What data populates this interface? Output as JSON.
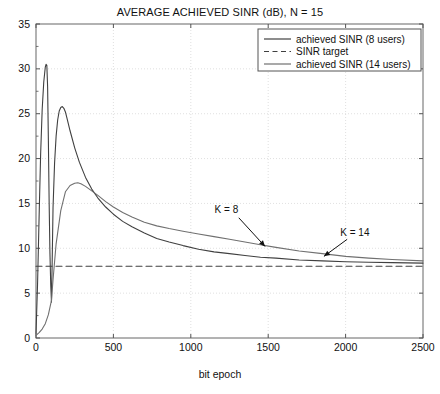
{
  "figure": {
    "title": "AVERAGE ACHIEVED SINR (dB), N = 15",
    "xlabel": "bit epoch",
    "ylabel": "",
    "caption": ""
  },
  "axes": {
    "x_ticks": [
      "0",
      "500",
      "1000",
      "1500",
      "2000",
      "2500"
    ],
    "y_ticks": [
      "0",
      "5",
      "10",
      "15",
      "20",
      "25",
      "30",
      "35"
    ]
  },
  "legend": {
    "items": [
      {
        "label": "achieved SINR (8 users)",
        "style": "solid",
        "color": "#404040"
      },
      {
        "label": "SINR target",
        "style": "dashed",
        "color": "#404040"
      },
      {
        "label": "achieved SINR (14 users)",
        "style": "solid",
        "color": "#707070"
      }
    ]
  },
  "annotations": [
    {
      "label": "K = 8",
      "x": 1230,
      "y": 13.9
    },
    {
      "label": "K = 14",
      "x": 2060,
      "y": 11.4
    }
  ],
  "chart_data": {
    "type": "line",
    "title": "AVERAGE ACHIEVED SINR (dB), N = 15",
    "xlabel": "bit epoch",
    "ylabel": "",
    "xlim": [
      0,
      2500
    ],
    "ylim": [
      0,
      35
    ],
    "xticks": [
      0,
      500,
      1000,
      1500,
      2000,
      2500
    ],
    "yticks": [
      0,
      5,
      10,
      15,
      20,
      25,
      30,
      35
    ],
    "grid": true,
    "legend_position": "top-right",
    "series": [
      {
        "name": "achieved SINR (8 users)",
        "style": "solid",
        "color": "#404040",
        "x": [
          0,
          10,
          20,
          30,
          40,
          50,
          60,
          65,
          70,
          75,
          80,
          85,
          90,
          95,
          100,
          105,
          110,
          120,
          130,
          140,
          150,
          160,
          170,
          180,
          190,
          200,
          220,
          250,
          280,
          320,
          360,
          400,
          450,
          500,
          560,
          620,
          700,
          780,
          860,
          950,
          1050,
          1150,
          1250,
          1350,
          1450,
          1550,
          1700,
          1850,
          2000,
          2150,
          2300,
          2500
        ],
        "y": [
          0.5,
          6.0,
          13.5,
          20.5,
          25.5,
          28.5,
          30.2,
          30.5,
          30.4,
          28.0,
          22.0,
          15.0,
          9.5,
          6.0,
          4.0,
          9.0,
          14.5,
          19.5,
          22.5,
          24.3,
          25.3,
          25.7,
          25.8,
          25.6,
          25.2,
          24.5,
          23.1,
          21.2,
          19.6,
          17.9,
          16.6,
          15.6,
          14.6,
          13.8,
          13.0,
          12.4,
          11.7,
          11.1,
          10.7,
          10.3,
          9.9,
          9.6,
          9.4,
          9.2,
          9.0,
          8.9,
          8.7,
          8.6,
          8.5,
          8.45,
          8.4,
          8.35
        ]
      },
      {
        "name": "SINR target",
        "style": "dashed",
        "color": "#404040",
        "x": [
          0,
          2500
        ],
        "y": [
          8.0,
          8.0
        ]
      },
      {
        "name": "achieved SINR (14 users)",
        "style": "solid",
        "color": "#707070",
        "x": [
          0,
          20,
          40,
          60,
          80,
          95,
          100,
          110,
          130,
          160,
          190,
          220,
          250,
          270,
          290,
          320,
          360,
          400,
          450,
          500,
          560,
          620,
          700,
          780,
          860,
          950,
          1050,
          1150,
          1250,
          1350,
          1450,
          1550,
          1700,
          1850,
          2000,
          2150,
          2300,
          2500
        ],
        "y": [
          0.3,
          0.6,
          1.0,
          1.6,
          2.6,
          3.8,
          4.2,
          6.5,
          10.5,
          14.2,
          16.3,
          17.0,
          17.25,
          17.3,
          17.2,
          16.9,
          16.4,
          15.9,
          15.2,
          14.6,
          14.0,
          13.5,
          12.9,
          12.5,
          12.2,
          11.9,
          11.6,
          11.3,
          11.0,
          10.7,
          10.4,
          10.1,
          9.7,
          9.4,
          9.1,
          8.9,
          8.75,
          8.6
        ]
      }
    ]
  }
}
